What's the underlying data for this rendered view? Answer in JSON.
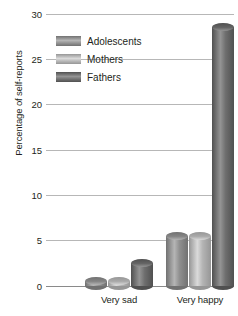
{
  "chart": {
    "type": "bar",
    "y_axis_title": "Percentage of self-reports"
  },
  "legend": {
    "items": [
      {
        "label": "Adolescents",
        "color": "#8f8f8f",
        "swatch_name": "legend-swatch-adolescents"
      },
      {
        "label": "Mothers",
        "color": "#b4b4b4",
        "swatch_name": "legend-swatch-mothers"
      },
      {
        "label": "Fathers",
        "color": "#6e6e6e",
        "swatch_name": "legend-swatch-fathers"
      }
    ]
  },
  "y_axis": {
    "ticks": [
      "0",
      "5",
      "10",
      "15",
      "20",
      "25",
      "30"
    ],
    "min": 0,
    "max": 30
  },
  "x_axis": {
    "categories": [
      "Very sad",
      "Very happy"
    ]
  },
  "chart_data": {
    "type": "bar",
    "title": "",
    "subtitle": "",
    "xlabel": "",
    "ylabel": "Percentage of self-reports",
    "categories": [
      "Very sad",
      "Very happy"
    ],
    "series": [
      {
        "name": "Adolescents",
        "values": [
          1,
          6
        ],
        "color": "#8f8f8f"
      },
      {
        "name": "Mothers",
        "values": [
          1,
          6
        ],
        "color": "#b4b4b4"
      },
      {
        "name": "Fathers",
        "values": [
          3,
          29
        ],
        "color": "#6e6e6e"
      }
    ],
    "ylim": [
      0,
      30
    ],
    "yticks": [
      0,
      5,
      10,
      15,
      20,
      25,
      30
    ],
    "grid": true,
    "legend_position": "upper-left-inside",
    "bar_style": "3d-cylinder"
  }
}
